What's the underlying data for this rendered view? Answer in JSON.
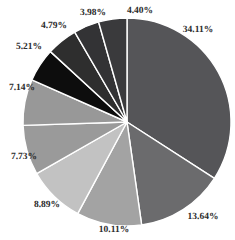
{
  "chart_data": {
    "type": "pie",
    "title": "",
    "xlabel": "",
    "ylabel": "",
    "legend": false,
    "grid": false,
    "start_angle_deg": 90,
    "direction": "clockwise",
    "center": {
      "x": 127,
      "y": 122
    },
    "radius": 104,
    "separator_color": "#ffffff",
    "background": "#ffffff",
    "label_color": "#2b2b2b",
    "categories": [
      "Slice 1",
      "Slice 2",
      "Slice 3",
      "Slice 4",
      "Slice 5",
      "Slice 6",
      "Slice 7",
      "Slice 8",
      "Slice 9",
      "Slice 10"
    ],
    "values": [
      34.11,
      13.64,
      10.11,
      8.89,
      7.73,
      7.14,
      5.21,
      4.79,
      3.98,
      4.4
    ],
    "labels": [
      "34.11%",
      "13.64%",
      "10.11%",
      "8.89%",
      "7.73%",
      "7.14%",
      "5.21%",
      "4.79%",
      "3.98%",
      "4.40%"
    ],
    "colors": [
      "#555558",
      "#6b6b6d",
      "#a3a3a3",
      "#c2c2c2",
      "#9a9a9a",
      "#989898",
      "#0d0d0d",
      "#2e2e2e",
      "#333335",
      "#3a3a3c"
    ],
    "label_positions": [
      {
        "x": 198,
        "y": 31
      },
      {
        "x": 203,
        "y": 218
      },
      {
        "x": 114,
        "y": 231
      },
      {
        "x": 47,
        "y": 206
      },
      {
        "x": 24,
        "y": 158
      },
      {
        "x": 22,
        "y": 89
      },
      {
        "x": 29,
        "y": 48
      },
      {
        "x": 54,
        "y": 27
      },
      {
        "x": 93,
        "y": 14
      },
      {
        "x": 140,
        "y": 12
      }
    ]
  }
}
